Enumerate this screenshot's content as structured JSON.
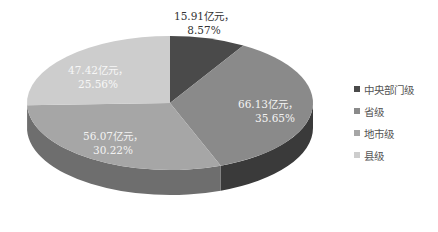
{
  "chart_data": {
    "type": "pie",
    "style": "3d",
    "title": "",
    "unit": "亿元",
    "categories": [
      "中央部门级",
      "省级",
      "地市级",
      "县级"
    ],
    "values": [
      15.91,
      66.13,
      56.07,
      47.42
    ],
    "percentages": [
      8.57,
      35.65,
      30.22,
      25.56
    ],
    "data_labels": [
      {
        "line1": "15.91亿元，",
        "line2": "8.57%"
      },
      {
        "line1": "66.13亿元，",
        "line2": "35.65%"
      },
      {
        "line1": "56.07亿元，",
        "line2": "30.22%"
      },
      {
        "line1": "47.42亿元，",
        "line2": "25.56%"
      }
    ],
    "colors": [
      "#4a4a4a",
      "#8a8a8a",
      "#a6a6a6",
      "#cdcdcd"
    ],
    "side_colors": [
      "#2e2e2e",
      "#3a3a3a",
      "#6e6e6e",
      "#8c8c8c"
    ],
    "start_angle": "12 o'clock, clockwise",
    "legend_position": "right"
  },
  "legend": {
    "items": [
      {
        "label": "中央部门级",
        "color": "#4a4a4a"
      },
      {
        "label": "省级",
        "color": "#8a8a8a"
      },
      {
        "label": "地市级",
        "color": "#a6a6a6"
      },
      {
        "label": "县级",
        "color": "#cdcdcd"
      }
    ]
  }
}
